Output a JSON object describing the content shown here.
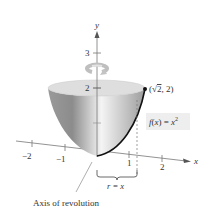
{
  "figure": {
    "type": "solid-of-revolution",
    "function_label": "f(x) = x²",
    "function_parts": {
      "f": "f",
      "open": "(",
      "x": "x",
      "close": ") = ",
      "base": "x",
      "exp": "2"
    },
    "point_label": "(√2, 2)",
    "point_parts": {
      "open": "(",
      "sqrt": "√",
      "rad": "2",
      "rest": ", 2)"
    },
    "radius_label": "r = x",
    "axis_caption": "Axis of revolution",
    "axes": {
      "x_label": "x",
      "y_label": "y",
      "x_ticks": [
        "−2",
        "−1",
        "1",
        "2"
      ],
      "y_ticks": [
        "2",
        "3"
      ]
    },
    "colors": {
      "surface_dark": "#8a8a8a",
      "surface_light": "#f2f2f2",
      "top_ellipse": "#d9d9d9",
      "curve": "#111111",
      "axis": "#666666",
      "label_box": "#eeeeee"
    }
  }
}
